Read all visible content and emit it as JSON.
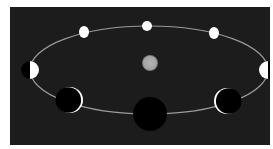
{
  "diagram": {
    "title": "Phases of Venus along its orbit around the Sun",
    "colors": {
      "page_background": "#ffffff",
      "panel_background": "#1c1c1c",
      "orbit": "#9a9a9a",
      "lit": "#ffffff",
      "dark": "#000000",
      "sun": "#a8a8a8"
    },
    "orbit": {
      "cx": 149,
      "cy": 70,
      "rx": 119,
      "ry": 44
    },
    "sun": {
      "cx": 150,
      "cy": 63,
      "r": 8,
      "label": "Sun"
    },
    "phases": [
      {
        "name": "full",
        "cx": 147,
        "cy": 26,
        "r": 5,
        "lit_side": "full"
      },
      {
        "name": "gibbous-left",
        "cx": 84,
        "cy": 32,
        "r": 6,
        "lit_side": "gibbous"
      },
      {
        "name": "gibbous-right",
        "cx": 214,
        "cy": 33,
        "r": 6,
        "lit_side": "gibbous"
      },
      {
        "name": "quarter-left",
        "cx": 30,
        "cy": 70,
        "r": 9,
        "lit_side": "right"
      },
      {
        "name": "quarter-right",
        "cx": 268,
        "cy": 70,
        "r": 9,
        "lit_side": "left"
      },
      {
        "name": "crescent-left",
        "cx": 70,
        "cy": 100,
        "r": 13,
        "lit_side": "right-crescent"
      },
      {
        "name": "crescent-right",
        "cx": 227,
        "cy": 101,
        "r": 13,
        "lit_side": "left-crescent"
      },
      {
        "name": "new",
        "cx": 150,
        "cy": 114,
        "r": 17,
        "lit_side": "none"
      }
    ]
  }
}
